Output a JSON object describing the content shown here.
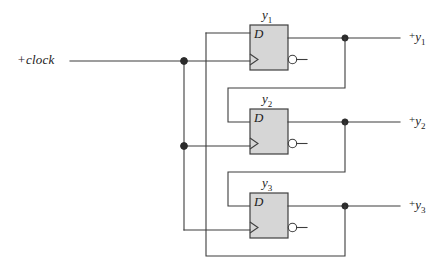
{
  "diagram": {
    "input_label": "+clock",
    "d_label": "D",
    "colors": {
      "wire": "#3d3d3d",
      "box_fill": "#d6d6d6",
      "box_stroke": "#3f3f3f",
      "junction": "#2b2b2b",
      "background": "#ffffff"
    },
    "flipflops": [
      {
        "name": "y",
        "sub": "1",
        "d_label": "D",
        "output_label_plus": "+",
        "output_label_base": "y",
        "output_label_sub": "1"
      },
      {
        "name": "y",
        "sub": "2",
        "d_label": "D",
        "output_label_plus": "+",
        "output_label_base": "y",
        "output_label_sub": "2"
      },
      {
        "name": "y",
        "sub": "3",
        "d_label": "D",
        "output_label_plus": "+",
        "output_label_base": "y",
        "output_label_sub": "3"
      }
    ],
    "outputs": [
      {
        "plus": "+",
        "base": "y",
        "sub": "1"
      },
      {
        "plus": "+",
        "base": "y",
        "sub": "2"
      },
      {
        "plus": "+",
        "base": "y",
        "sub": "3"
      }
    ],
    "nets": {
      "clock_bus_x": 184,
      "feedback_bus_x": 206,
      "stage_feedback_x": 228,
      "output_tap_x": 345,
      "clock_junctions_y": [
        61,
        146
      ],
      "output_taps_y": [
        38,
        122,
        206
      ]
    }
  }
}
